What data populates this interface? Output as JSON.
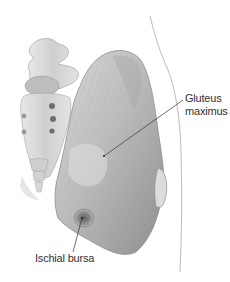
{
  "figure": {
    "type": "anatomical-illustration",
    "labels": [
      {
        "id": "gluteus",
        "line1": "Gluteus",
        "line2": "maximus"
      },
      {
        "id": "ischial",
        "text": "Ischial bursa"
      }
    ]
  },
  "colors": {
    "background": "#ffffff",
    "muscle": "#b9b9b9",
    "muscle_dark": "#8a8a8a",
    "bone": "#d6d6d6",
    "outline": "#9a9a9a",
    "leader_line": "#333333",
    "bursa": "#7a7a7a"
  }
}
